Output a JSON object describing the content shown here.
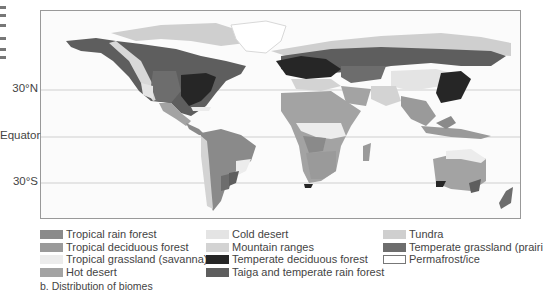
{
  "figure": {
    "caption": "b. Distribution of biomes"
  },
  "latitudes": [
    {
      "label": "30°N",
      "y": 89
    },
    {
      "label": "Equator",
      "y": 136
    },
    {
      "label": "30°S",
      "y": 182
    }
  ],
  "legend": {
    "columns": [
      [
        {
          "label": "Tropical rain forest",
          "color": "#8a8a8a",
          "border": "none"
        },
        {
          "label": "Tropical deciduous forest",
          "color": "#9a9a9a",
          "border": "none"
        },
        {
          "label": "Tropical grassland (savanna)",
          "color": "#ececec",
          "border": "none"
        },
        {
          "label": "Hot desert",
          "color": "#a3a3a3",
          "border": "none"
        }
      ],
      [
        {
          "label": "Cold desert",
          "color": "#e4e4e4",
          "border": "none"
        },
        {
          "label": "Mountain ranges",
          "color": "#d3d3d3",
          "border": "none"
        },
        {
          "label": "Temperate deciduous forest",
          "color": "#262626",
          "border": "none"
        },
        {
          "label": "Taiga and temperate rain forest",
          "color": "#5e5e5e",
          "border": "none"
        }
      ],
      [
        {
          "label": "Tundra",
          "color": "#cfcfcf",
          "border": "none"
        },
        {
          "label": "Temperate grassland (prairie)",
          "color": "#6d6d6d",
          "border": "none"
        },
        {
          "label": "Permafrost/ice",
          "color": "#ffffff",
          "border": "1px solid #777"
        }
      ]
    ]
  },
  "colors": {
    "frame": "#999999",
    "ocean": "#fbfbfb",
    "gridline": "#c8c8c8"
  }
}
